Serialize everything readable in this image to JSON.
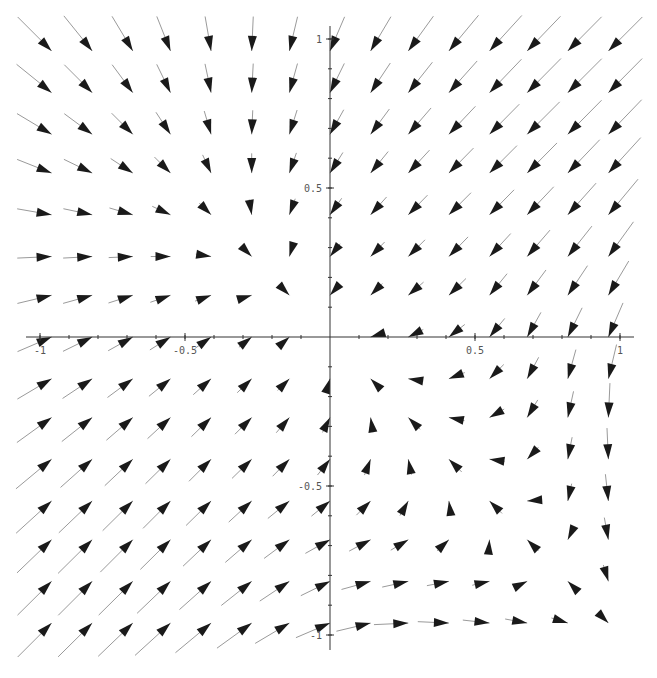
{
  "chart_data": {
    "type": "vector_field",
    "title": "",
    "xlabel": "",
    "ylabel": "",
    "xlim": [
      -1,
      1
    ],
    "ylim": [
      -1,
      1
    ],
    "grid": false,
    "x_ticks": [
      {
        "value": -1,
        "label": "-1"
      },
      {
        "value": -0.5,
        "label": "-0.5"
      },
      {
        "value": 0.5,
        "label": "0.5"
      },
      {
        "value": 1,
        "label": "1"
      }
    ],
    "y_ticks": [
      {
        "value": 1,
        "label": "1"
      },
      {
        "value": 0.5,
        "label": "0.5"
      },
      {
        "value": -0.5,
        "label": "-0.5"
      },
      {
        "value": -1,
        "label": "-1"
      }
    ],
    "sample_grid": {
      "x": [
        -0.96,
        -0.82,
        -0.68,
        -0.55,
        -0.41,
        -0.27,
        -0.14,
        0.0,
        0.14,
        0.27,
        0.41,
        0.55,
        0.68,
        0.82,
        0.96
      ],
      "y": [
        0.96,
        0.82,
        0.68,
        0.55,
        0.41,
        0.27,
        0.14,
        0.0,
        -0.14,
        -0.27,
        -0.41,
        -0.55,
        -0.68,
        -0.82,
        -0.96
      ]
    },
    "arrow_style": {
      "shaft_color": "#9a9a9a",
      "head_color": "#1a1a1a"
    }
  },
  "axes": {
    "color": "#333333"
  }
}
